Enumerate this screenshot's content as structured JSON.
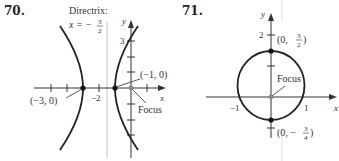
{
  "figures": [
    {
      "number": "70.",
      "type": "hyperbola",
      "labels": {
        "directrix_title": "Directrix:",
        "directrix_eq_lhs": "x = −",
        "directrix_num": "3",
        "directrix_den": "2",
        "y_axis": "y",
        "x_axis": "x",
        "tick_y3": "3",
        "tick_xm2": "−2",
        "vertex_left": "(−3, 0)",
        "vertex_right": "(−1, 0)",
        "focus": "Focus"
      }
    },
    {
      "number": "71.",
      "type": "ellipse",
      "labels": {
        "y_axis": "y",
        "x_axis": "x",
        "tick_y2": "2",
        "tick_xm1": "−1",
        "tick_x1": "1",
        "top_point_prefix": "(0, ",
        "top_point_num": "3",
        "top_point_den": "2",
        "top_point_suffix": ")",
        "bottom_point_prefix": "(0, −",
        "bottom_point_num": "3",
        "bottom_point_den": "4",
        "bottom_point_suffix": ")",
        "focus": "Focus"
      }
    }
  ],
  "colors": {
    "curve": "#222222",
    "axis": "#333333",
    "directrix": "#bbbbbb",
    "focus_point": "#888888",
    "vertex_point": "#111111"
  }
}
